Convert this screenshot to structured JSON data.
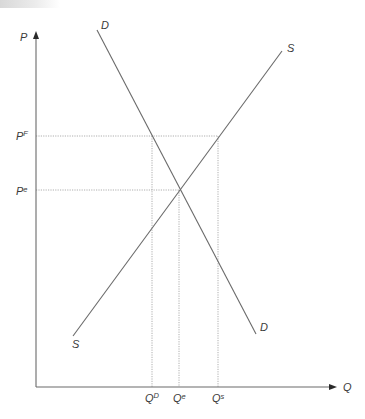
{
  "diagram": {
    "title": "",
    "type": "supply-demand price floor diagram",
    "axes": {
      "y_label": "P",
      "x_label": "Q"
    },
    "curves": {
      "demand": {
        "label_top": "D",
        "label_bottom": "D"
      },
      "supply": {
        "label_top": "S",
        "label_bottom": "S"
      }
    },
    "price_levels": {
      "floor": {
        "base": "P",
        "sup": "F"
      },
      "equilibrium": {
        "base": "P",
        "sup": "e"
      }
    },
    "quantity_levels": {
      "demanded": {
        "base": "Q",
        "sup": "D"
      },
      "equilibrium": {
        "base": "Q",
        "sup": "e"
      },
      "supplied": {
        "base": "Q",
        "sup": "s"
      }
    },
    "colors": {
      "axis": "#6a6a6a",
      "curve": "#6a6a6a",
      "guide": "#9a9a9a",
      "text": "#3a3a3a"
    }
  }
}
